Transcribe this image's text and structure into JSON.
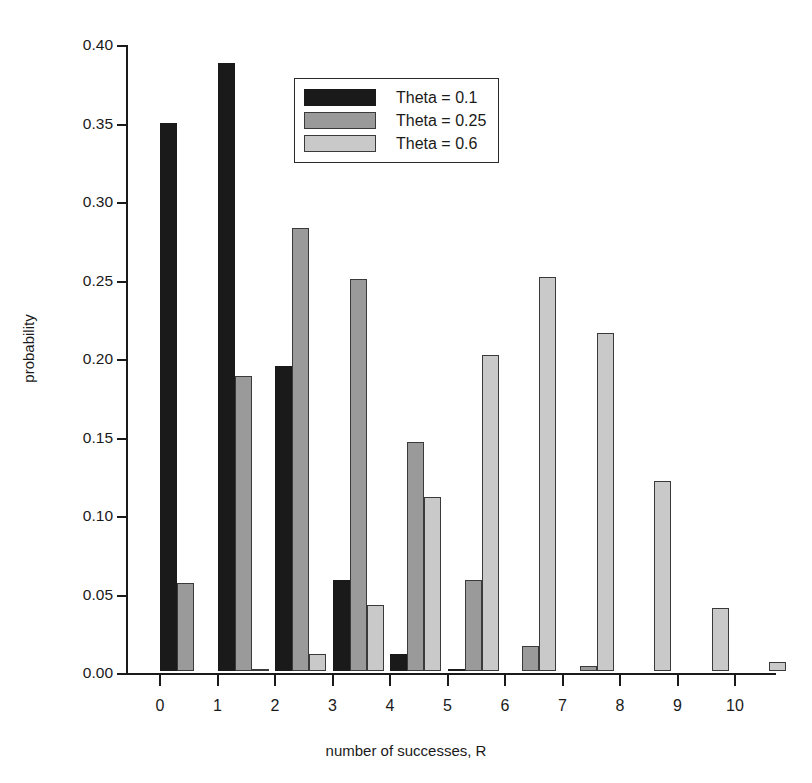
{
  "chart_data": {
    "type": "bar",
    "title": "",
    "xlabel": "number of successes, R",
    "ylabel": "probability",
    "categories": [
      "0",
      "1",
      "2",
      "3",
      "4",
      "5",
      "6",
      "7",
      "8",
      "9",
      "10"
    ],
    "x": [
      0,
      1,
      2,
      3,
      4,
      5,
      6,
      7,
      8,
      9,
      10
    ],
    "ylim": [
      0.0,
      0.4
    ],
    "xlim": [
      -0.5,
      11.0
    ],
    "ytick_labels": [
      "0.00",
      "0.05",
      "0.10",
      "0.15",
      "0.20",
      "0.25",
      "0.30",
      "0.35",
      "0.40"
    ],
    "ytick_values": [
      0.0,
      0.05,
      0.1,
      0.15,
      0.2,
      0.25,
      0.3,
      0.35,
      0.4
    ],
    "grid": false,
    "legend_position": "upper-center",
    "series": [
      {
        "name": "Theta = 0.1",
        "color": "#1a1a1a",
        "values": [
          0.349,
          0.387,
          0.194,
          0.058,
          0.011,
          0.0015,
          0.0,
          0.0,
          0.0,
          0.0,
          0.0
        ]
      },
      {
        "name": "Theta = 0.25",
        "color": "#9a9a9a",
        "values": [
          0.056,
          0.188,
          0.282,
          0.25,
          0.146,
          0.058,
          0.016,
          0.0031,
          0.0,
          0.0,
          0.0
        ]
      },
      {
        "name": "Theta = 0.6",
        "color": "#c9c9c9",
        "values": [
          0.0,
          0.0016,
          0.0106,
          0.042,
          0.111,
          0.201,
          0.251,
          0.215,
          0.121,
          0.04,
          0.006
        ]
      }
    ]
  },
  "legend": {
    "entries": [
      {
        "label": "Theta = 0.1",
        "color": "#1a1a1a"
      },
      {
        "label": "Theta = 0.25",
        "color": "#9a9a9a"
      },
      {
        "label": "Theta = 0.6",
        "color": "#c9c9c9"
      }
    ]
  },
  "axes": {
    "y_title": "probability",
    "x_title": "number of successes, R"
  }
}
